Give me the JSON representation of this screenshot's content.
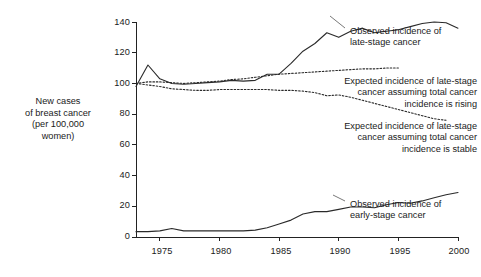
{
  "chart_data": {
    "type": "line",
    "title": "",
    "xlabel": "",
    "ylabel": "New cases of breast cancer (per 100,000 women)",
    "xlim": [
      1973,
      2000
    ],
    "ylim": [
      0,
      140
    ],
    "yticks": [
      0,
      20,
      40,
      60,
      80,
      100,
      120,
      140
    ],
    "xticks": [
      1975,
      1980,
      1985,
      1990,
      1995,
      2000
    ],
    "grid": false,
    "legend_position": "inline-annotations",
    "x": [
      1973,
      1974,
      1975,
      1976,
      1977,
      1978,
      1979,
      1980,
      1981,
      1982,
      1983,
      1984,
      1985,
      1986,
      1987,
      1988,
      1989,
      1990,
      1991,
      1992,
      1993,
      1994,
      1995,
      1996,
      1997,
      1998,
      1999,
      2000
    ],
    "series": [
      {
        "name": "Observed incidence of late-stage cancer",
        "style": "solid",
        "values": [
          98,
          112,
          103,
          100,
          99.5,
          100,
          100.5,
          101,
          102,
          101.5,
          102,
          106,
          106,
          113,
          121,
          126,
          133,
          130,
          134,
          136,
          133,
          134,
          135,
          137,
          139,
          140,
          139.5,
          136
        ]
      },
      {
        "name": "Expected incidence of late-stage cancer assuming total cancer incidence is rising",
        "style": "dotted",
        "values": [
          100,
          101,
          101,
          100.5,
          100,
          100.5,
          101,
          101.5,
          102.5,
          103,
          104,
          105,
          106,
          106.5,
          107,
          107.5,
          108,
          108.5,
          109,
          109.5,
          109.5,
          110,
          110,
          null,
          null,
          null,
          null,
          null
        ]
      },
      {
        "name": "Expected incidence of late-stage cancer assuming total cancer incidence is stable",
        "style": "dotted",
        "values": [
          100,
          99,
          98,
          96.5,
          96,
          95.5,
          95.5,
          96,
          96,
          96,
          96,
          96,
          95.5,
          95.5,
          95,
          94,
          92,
          92.5,
          91,
          89,
          87,
          85,
          83,
          81,
          79,
          77,
          76,
          null
        ]
      },
      {
        "name": "Observed incidence of early-stage cancer",
        "style": "solid",
        "values": [
          3.5,
          3.5,
          4,
          5.5,
          4,
          4,
          4,
          4,
          4,
          4,
          4.5,
          6,
          8.5,
          11,
          15,
          16.5,
          16.5,
          18,
          19.5,
          19.5,
          19,
          21,
          22.5,
          22,
          23.5,
          25.5,
          27.5,
          29
        ]
      }
    ]
  },
  "axis": {
    "y_title": "New cases\nof breast cancer\n(per 100,000\nwomen)",
    "y_title_lines": [
      "New cases",
      "of breast cancer",
      "(per 100,000",
      "women)"
    ],
    "ytick_labels": [
      "0",
      "20",
      "40",
      "60",
      "80",
      "100",
      "120",
      "140"
    ],
    "xtick_labels": [
      "1975",
      "1980",
      "1985",
      "1990",
      "1995",
      "2000"
    ]
  },
  "annotations": [
    {
      "id": "observed-late-stage",
      "lines": [
        "Observed incidence of",
        "late-stage cancer"
      ],
      "align": "left"
    },
    {
      "id": "expected-rising",
      "lines": [
        "Expected incidence of late-stage",
        "cancer assuming total cancer",
        "incidence is rising"
      ],
      "align": "right"
    },
    {
      "id": "expected-stable",
      "lines": [
        "Expected incidence of late-stage",
        "cancer assuming total cancer",
        "incidence is stable"
      ],
      "align": "right"
    },
    {
      "id": "observed-early-stage",
      "lines": [
        "Observed incidence of",
        "early-stage cancer"
      ],
      "align": "left"
    }
  ],
  "colors": {
    "line": "#2a2a2a",
    "axis": "#222222",
    "text": "#1a1a1a",
    "background": "#ffffff"
  }
}
